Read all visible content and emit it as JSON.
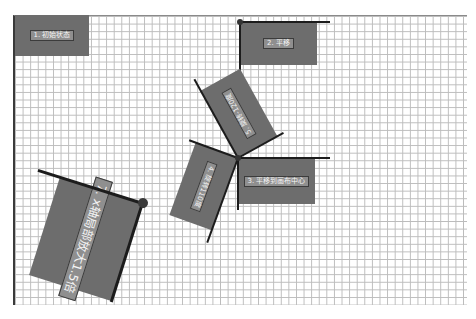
{
  "canvas": {
    "grid_cell_px": 7.6,
    "grid_color": "#bcbcbc",
    "box_color": "#6d6d6d",
    "label_bg_color": "#8f8f8f",
    "axis_color": "#1c1c1c"
  },
  "steps": {
    "s1": {
      "label": "1. 初始状态"
    },
    "s2": {
      "label": "2. 平移"
    },
    "s3": {
      "label": "3. 平移到画布中心"
    },
    "s4": {
      "label": "4. 旋转110度"
    },
    "s5": {
      "label": "5. 旋转-120度"
    },
    "s7": {
      "label": "7. x轴局部放大1.5倍"
    }
  }
}
